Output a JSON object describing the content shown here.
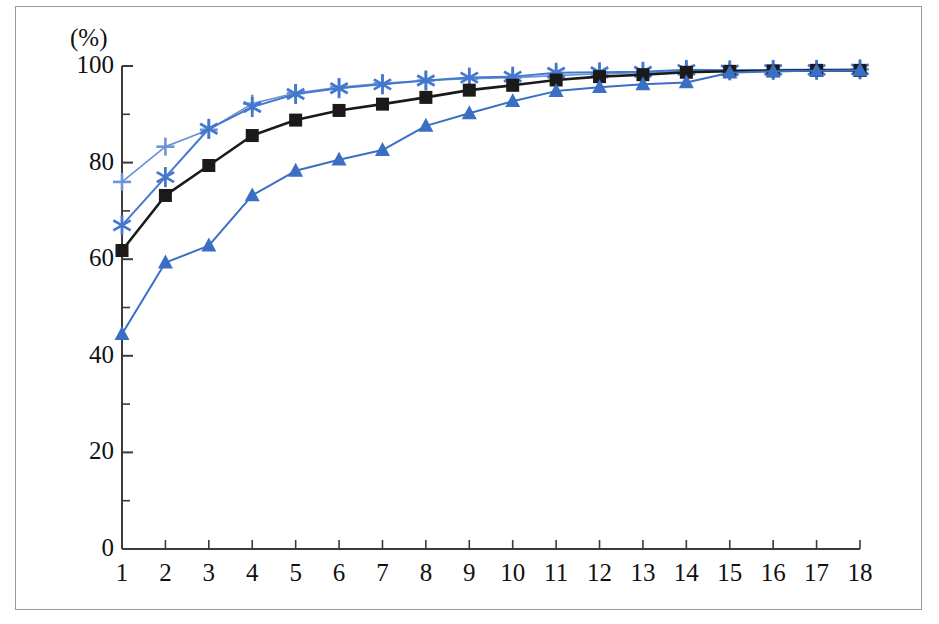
{
  "chart_data": {
    "type": "line",
    "title": "",
    "subtitle": "",
    "xlabel": "",
    "ylabel": "",
    "unit_label": "(%)",
    "grid": false,
    "legend_position": "none",
    "xlim": [
      1,
      18
    ],
    "ylim": [
      0,
      100
    ],
    "x": [
      1,
      2,
      3,
      4,
      5,
      6,
      7,
      8,
      9,
      10,
      11,
      12,
      13,
      14,
      15,
      16,
      17,
      18
    ],
    "xticklabels": [
      "1",
      "2",
      "3",
      "4",
      "5",
      "6",
      "7",
      "8",
      "9",
      "10",
      "11",
      "12",
      "13",
      "14",
      "15",
      "16",
      "17",
      "18"
    ],
    "yticks": [
      0,
      20,
      40,
      60,
      80,
      100
    ],
    "yticklabels": [
      "0",
      "20",
      "40",
      "60",
      "80",
      "100"
    ],
    "yminorticks": [
      10,
      30,
      50,
      70,
      90
    ],
    "series": [
      {
        "name": "series-plus",
        "marker": "plus",
        "color": "#6E93D6",
        "values": [
          76.0,
          83.3,
          86.8,
          92.2,
          94.4,
          95.6,
          96.4,
          97.0,
          97.4,
          97.6,
          98.0,
          98.4,
          98.6,
          98.9,
          99.0,
          99.1,
          99.2,
          99.3
        ]
      },
      {
        "name": "series-asterisk",
        "marker": "asterisk",
        "color": "#4478CE",
        "values": [
          67.0,
          77.0,
          87.0,
          91.5,
          94.2,
          95.4,
          96.2,
          97.0,
          97.6,
          97.8,
          98.6,
          98.7,
          98.8,
          99.2,
          99.1,
          99.2,
          99.2,
          99.3
        ]
      },
      {
        "name": "series-square",
        "marker": "square",
        "color": "#1a1a1a",
        "values": [
          61.8,
          73.2,
          79.4,
          85.6,
          88.8,
          90.8,
          92.1,
          93.5,
          95.0,
          96.0,
          97.1,
          97.8,
          98.2,
          98.7,
          98.9,
          99.0,
          99.1,
          99.1
        ]
      },
      {
        "name": "series-triangle",
        "marker": "triangle",
        "color": "#3A6FC4",
        "values": [
          44.5,
          59.3,
          62.8,
          73.2,
          78.3,
          80.6,
          82.6,
          87.6,
          90.2,
          92.7,
          94.8,
          95.6,
          96.2,
          96.6,
          98.6,
          98.9,
          99.0,
          99.1
        ]
      }
    ]
  },
  "axes": {
    "unit": "(%)"
  }
}
